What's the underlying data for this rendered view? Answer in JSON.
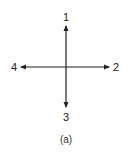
{
  "diagram": {
    "type": "direction-axes",
    "caption": "(a)",
    "color": "#222222",
    "center": {
      "x": 66,
      "y": 67
    },
    "arrows": [
      {
        "id": 1,
        "label": "1",
        "direction": "up"
      },
      {
        "id": 2,
        "label": "2",
        "direction": "right"
      },
      {
        "id": 3,
        "label": "3",
        "direction": "down"
      },
      {
        "id": 4,
        "label": "4",
        "direction": "left"
      }
    ]
  }
}
